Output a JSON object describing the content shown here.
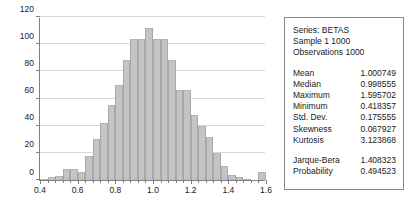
{
  "chart_data": {
    "type": "bar",
    "title": "",
    "xlabel": "",
    "ylabel": "",
    "xlim": [
      0.4,
      1.6
    ],
    "ylim": [
      0,
      120
    ],
    "ytick_labels": [
      "0",
      "20",
      "40",
      "60",
      "80",
      "100",
      "120"
    ],
    "ytick_values": [
      0,
      20,
      40,
      60,
      80,
      100,
      120
    ],
    "xtick_labels": [
      "0.4",
      "0.6",
      "0.8",
      "1.0",
      "1.2",
      "1.4",
      "1.6"
    ],
    "xtick_values": [
      0.4,
      0.6,
      0.8,
      1.0,
      1.2,
      1.4,
      1.6
    ],
    "grid": true,
    "legend": "none",
    "bin_width": 0.04,
    "bin_starts": [
      0.4,
      0.44,
      0.48,
      0.52,
      0.56,
      0.6,
      0.64,
      0.68,
      0.72,
      0.76,
      0.8,
      0.84,
      0.88,
      0.92,
      0.96,
      1.0,
      1.04,
      1.08,
      1.12,
      1.16,
      1.2,
      1.24,
      1.28,
      1.32,
      1.36,
      1.4,
      1.44,
      1.48,
      1.52,
      1.56
    ],
    "categories": [
      "0.40-0.44",
      "0.44-0.48",
      "0.48-0.52",
      "0.52-0.56",
      "0.56-0.60",
      "0.60-0.64",
      "0.64-0.68",
      "0.68-0.72",
      "0.72-0.76",
      "0.76-0.80",
      "0.80-0.84",
      "0.84-0.88",
      "0.88-0.92",
      "0.92-0.96",
      "0.96-1.00",
      "1.00-1.04",
      "1.04-1.08",
      "1.08-1.12",
      "1.12-1.16",
      "1.16-1.20",
      "1.20-1.24",
      "1.24-1.28",
      "1.28-1.32",
      "1.32-1.36",
      "1.36-1.40",
      "1.40-1.44",
      "1.44-1.48",
      "1.48-1.52",
      "1.52-1.56",
      "1.56-1.60"
    ],
    "values": [
      1,
      2,
      3,
      8,
      8,
      6,
      18,
      30,
      42,
      55,
      70,
      88,
      104,
      104,
      112,
      104,
      104,
      88,
      66,
      66,
      48,
      40,
      32,
      20,
      10,
      4,
      2,
      1,
      0,
      6
    ]
  },
  "stats": {
    "header": [
      "Series: BETAS",
      "Sample 1 1000",
      "Observations 1000"
    ],
    "rows": [
      {
        "key": "Mean",
        "value": "1.000749"
      },
      {
        "key": "Median",
        "value": "0.998555"
      },
      {
        "key": "Maximum",
        "value": "1.595702"
      },
      {
        "key": "Minimum",
        "value": "0.418357"
      },
      {
        "key": "Std. Dev.",
        "value": "0.175555"
      },
      {
        "key": "Skewness",
        "value": "0.067927"
      },
      {
        "key": "Kurtosis",
        "value": "3.123868"
      }
    ],
    "tests": [
      {
        "key": "Jarque-Bera",
        "value": "1.408323"
      },
      {
        "key": "Probability",
        "value": "0.494523"
      }
    ]
  },
  "colors": {
    "bar_fill": "#c4c4c4",
    "bar_edge": "#a8a8a8",
    "axis": "#808080",
    "grid": "#d9d9d9",
    "box_border": "#8a8a8a",
    "text": "#1a1a1a",
    "background": "#ffffff"
  }
}
